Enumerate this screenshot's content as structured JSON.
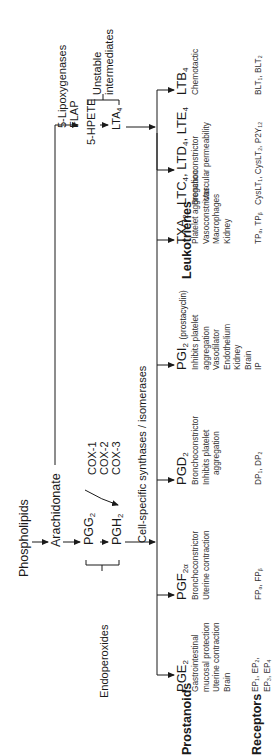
{
  "pathway": {
    "source": "Phospholipids",
    "precursor": "Arachidonate",
    "lipoxygenase_branch": {
      "enzymes": [
        "5-Lipoxygenases",
        "FLAP"
      ],
      "intermediate_1": "5-HPETE",
      "intermediate_2": "LTA",
      "intermediate_2_sub": "4",
      "bracket_label": [
        "Unstable",
        "intermediates"
      ]
    },
    "cyclooxygenase_branch": {
      "intermediate_1": "PGG",
      "intermediate_1_sub": "2",
      "intermediate_2": "PGH",
      "intermediate_2_sub": "2",
      "enzymes": [
        "COX-1",
        "COX-2",
        "COX-3"
      ],
      "bracket_label": "Endoperoxides",
      "synthases_label": "Cell-specific synthases / isomerases"
    }
  },
  "row_labels": {
    "prostanoids": "Prostanoids",
    "leukotrienes": "Leukotrienes",
    "receptors": "Receptors"
  },
  "prostanoids": [
    {
      "name": "PGE",
      "sub": "2",
      "extra": "",
      "effects": [
        "Gastrointestinal",
        "mucosal protection",
        "Uterine contraction",
        "Brain"
      ],
      "receptors": [
        "EP1, EP2,",
        "EP3, EP4"
      ]
    },
    {
      "name": "PGF",
      "sub": "2α",
      "extra": "",
      "effects": [
        "Bronchoconstrictor",
        "Uterine contraction"
      ],
      "receptors": [
        "FPα, FPβ"
      ]
    },
    {
      "name": "PGD",
      "sub": "2",
      "extra": "",
      "effects": [
        "Bronchoconstrictor",
        "Inhibits platelet",
        "aggregation"
      ],
      "receptors": [
        "DP1, DP2"
      ]
    },
    {
      "name": "PGI",
      "sub": "2",
      "extra": "(prostacyclin)",
      "effects": [
        "Inhibits platelet",
        "aggregation",
        "Vasodilator",
        "Endothelium",
        "Kidney",
        "Brain"
      ],
      "receptors": [
        "IP"
      ]
    },
    {
      "name": "TXA",
      "sub": "2",
      "extra": "",
      "effects": [
        "Platelet aggregation",
        "Vasoconstrictor",
        "Macrophages",
        "Kidney"
      ],
      "receptors": [
        "TPα, TPβ"
      ]
    }
  ],
  "leukotrienes": [
    {
      "name": "LTC4, LTD4, LTE4",
      "effects": [
        "Bronchoconstrictor",
        "↑Vascular permeability"
      ],
      "receptors": [
        "CysLT1, CysLT2, P2Y12"
      ]
    },
    {
      "name": "LTB",
      "sub": "4",
      "effects": [
        "Chemotactic"
      ],
      "receptors": [
        "BLT1, BLT2"
      ]
    }
  ]
}
